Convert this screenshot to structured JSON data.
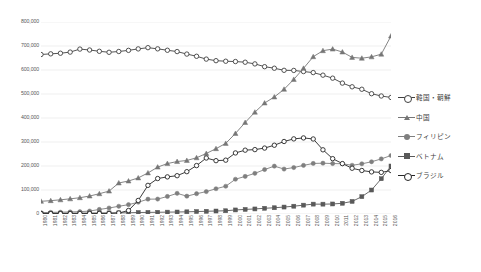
{
  "chart_data": {
    "type": "line",
    "title": "",
    "xlabel": "",
    "ylabel": "",
    "ylim": [
      0,
      800000
    ],
    "ytick_step": 100000,
    "grid": true,
    "legend_position": "right",
    "x": [
      1980,
      1981,
      1982,
      1983,
      1984,
      1985,
      1986,
      1987,
      1988,
      1989,
      1990,
      1991,
      1992,
      1993,
      1994,
      1995,
      1996,
      1997,
      1998,
      1999,
      2000,
      2001,
      2002,
      2003,
      2004,
      2005,
      2006,
      2007,
      2008,
      2009,
      2010,
      2011,
      2012,
      2013,
      2014,
      2015,
      2016
    ],
    "ytick_labels": [
      "0",
      "100,000",
      "200,000",
      "300,000",
      "400,000",
      "500,000",
      "600,000",
      "700,000",
      "800,000"
    ],
    "ytick_values": [
      0,
      100000,
      200000,
      300000,
      400000,
      500000,
      600000,
      700000,
      800000
    ],
    "series": [
      {
        "name": "韓国・朝鮮",
        "marker": "open-circle",
        "color": "#404040",
        "values": [
          664536,
          667325,
          669854,
          674581,
          687135,
          683313,
          677959,
          673787,
          677140,
          681838,
          687940,
          693050,
          688144,
          682276,
          676793,
          666376,
          657159,
          645373,
          638828,
          636548,
          635269,
          632405,
          625422,
          613791,
          607419,
          598687,
          598219,
          593489,
          589239,
          578495,
          565989,
          545401,
          530048,
          519740,
          501230,
          491711,
          485557
        ]
      },
      {
        "name": "中国",
        "marker": "triangle",
        "color": "#767676",
        "values": [
          52896,
          55616,
          59122,
          63164,
          67895,
          74924,
          84397,
          95477,
          129269,
          137499,
          150339,
          171071,
          195334,
          210138,
          218585,
          222991,
          234264,
          252164,
          272230,
          294201,
          335575,
          381225,
          424282,
          462396,
          487570,
          519561,
          560741,
          606889,
          655377,
          680518,
          687156,
          674879,
          652595,
          649078,
          654777,
          665847,
          741656
        ]
      },
      {
        "name": "フィリピン",
        "marker": "filled-circle",
        "color": "#7f7f7f",
        "values": [
          5547,
          6729,
          7516,
          8527,
          9618,
          12261,
          18897,
          25017,
          32185,
          38925,
          49092,
          61837,
          62218,
          73057,
          85968,
          74297,
          84509,
          93265,
          105308,
          115685,
          144871,
          156667,
          169359,
          185237,
          199394,
          187261,
          193488,
          202592,
          210617,
          211716,
          210181,
          209376,
          202985,
          209183,
          217585,
          229595,
          243662
        ]
      },
      {
        "name": "ベトナム",
        "marker": "filled-square",
        "color": "#595959",
        "values": [
          2742,
          2892,
          3113,
          3386,
          3767,
          4126,
          4381,
          4551,
          4793,
          5033,
          6233,
          6724,
          7195,
          7768,
          8280,
          9099,
          10228,
          11319,
          12431,
          13505,
          16908,
          19140,
          21050,
          23853,
          26018,
          28932,
          32485,
          36860,
          41136,
          41000,
          41781,
          44690,
          52367,
          72256,
          99865,
          146956,
          199990
        ]
      },
      {
        "name": "ブラジル",
        "marker": "open-circle-2",
        "color": "#262626",
        "values": [
          1492,
          1542,
          1574,
          1610,
          1796,
          1955,
          2135,
          2250,
          4159,
          14528,
          56429,
          119333,
          147803,
          154650,
          159619,
          176440,
          201795,
          233254,
          222217,
          224299,
          254394,
          265962,
          268332,
          274700,
          286557,
          302080,
          312979,
          316967,
          312582,
          267456,
          230552,
          210032,
          190609,
          181317,
          175410,
          173437,
          180923
        ]
      }
    ]
  },
  "legend": {
    "items": [
      {
        "label": "韓国・朝鮮",
        "marker": "open-circle",
        "color": "#404040"
      },
      {
        "label": "中国",
        "marker": "triangle",
        "color": "#767676"
      },
      {
        "label": "フィリピン",
        "marker": "filled-circle",
        "color": "#7f7f7f"
      },
      {
        "label": "ベトナム",
        "marker": "filled-square",
        "color": "#595959"
      },
      {
        "label": "ブラジル",
        "marker": "open-circle-2",
        "color": "#262626"
      }
    ]
  },
  "colors": {
    "grid": "#e8e8e8",
    "axis_text": "#595959",
    "background": "#ffffff"
  }
}
